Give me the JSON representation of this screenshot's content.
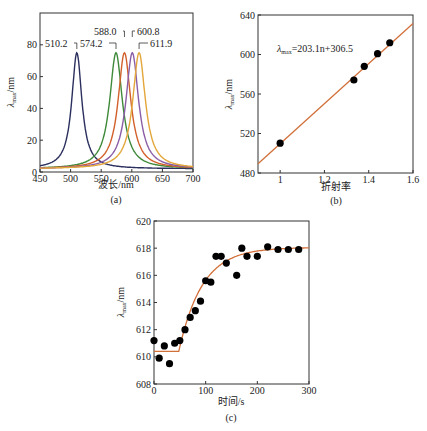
{
  "chart_data": [
    {
      "panel": "(a)",
      "type": "line",
      "xlabel": "波长/nm",
      "ylabel": "λmax/nm",
      "xlim": [
        450,
        700
      ],
      "ylim": [
        0,
        100
      ],
      "xticks": [
        450,
        500,
        550,
        600,
        650,
        700
      ],
      "yticks": [
        0,
        20,
        40,
        60,
        80
      ],
      "series": [
        {
          "name": "510.2",
          "peak_x": 510.2,
          "peak_y": 75,
          "color": "#2b2f5e"
        },
        {
          "name": "574.2",
          "peak_x": 574.2,
          "peak_y": 75,
          "color": "#3f8a3a"
        },
        {
          "name": "588.0",
          "peak_x": 588.0,
          "peak_y": 75,
          "color": "#d2602a"
        },
        {
          "name": "600.8",
          "peak_x": 600.8,
          "peak_y": 75,
          "color": "#8a5ea6"
        },
        {
          "name": "611.9",
          "peak_x": 611.9,
          "peak_y": 75,
          "color": "#e3a63a"
        }
      ],
      "annotations": [
        "510.2",
        "574.2",
        "588.0",
        "600.8",
        "611.9"
      ]
    },
    {
      "panel": "(b)",
      "type": "scatter",
      "xlabel": "折射率",
      "ylabel": "λmax/nm",
      "xlim": [
        0.9,
        1.6
      ],
      "ylim": [
        480,
        640
      ],
      "xticks": [
        1,
        1.2,
        1.4,
        1.6
      ],
      "yticks": [
        480,
        520,
        560,
        600,
        640
      ],
      "x": [
        1.0,
        1.333,
        1.38,
        1.44,
        1.495
      ],
      "y": [
        510.2,
        574.2,
        588.0,
        600.8,
        611.9
      ],
      "fit": {
        "slope": 203.1,
        "intercept": 306.5,
        "color": "#d2703a"
      },
      "equation_label": "λmax=203.1n+306.5"
    },
    {
      "panel": "(c)",
      "type": "scatter",
      "xlabel": "时间/s",
      "ylabel": "λmax/nm",
      "xlim": [
        0,
        300
      ],
      "ylim": [
        608,
        620
      ],
      "xticks": [
        0,
        100,
        200,
        300
      ],
      "yticks": [
        608,
        610,
        612,
        614,
        616,
        618,
        620
      ],
      "x": [
        0,
        10,
        20,
        30,
        40,
        50,
        60,
        70,
        80,
        90,
        100,
        110,
        120,
        130,
        140,
        160,
        170,
        180,
        200,
        220,
        240,
        260,
        280
      ],
      "y": [
        611.2,
        609.9,
        610.8,
        609.5,
        611.0,
        611.2,
        612.0,
        612.9,
        613.4,
        614.1,
        615.6,
        615.5,
        617.4,
        617.4,
        616.9,
        616.0,
        618.0,
        617.4,
        617.4,
        618.1,
        617.9,
        617.9,
        617.9
      ],
      "fit_color": "#d2703a"
    }
  ],
  "labels": {
    "a": {
      "xlabel": "波长/nm",
      "panel": "(a)",
      "ylabel_main": "λ",
      "ylabel_sub": "max",
      "ylabel_unit": "/nm"
    },
    "b": {
      "xlabel": "折射率",
      "panel": "(b)",
      "ylabel_main": "λ",
      "ylabel_sub": "max",
      "ylabel_unit": "/nm",
      "eq_main": "λ",
      "eq_sub": "max",
      "eq_rest": "=203.1n+306.5"
    },
    "c": {
      "xlabel": "时间/s",
      "panel": "(c)",
      "ylabel_main": "λ",
      "ylabel_sub": "max",
      "ylabel_unit": "/nm"
    }
  }
}
